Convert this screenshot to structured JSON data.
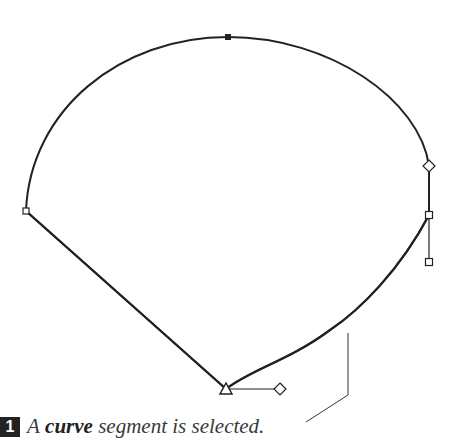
{
  "caption": {
    "step_number": "1",
    "prefix": "A",
    "emphasis": "curve",
    "suffix": "segment is selected."
  },
  "colors": {
    "stroke": "#222222",
    "background": "#ffffff",
    "badge": "#222222"
  },
  "shape": {
    "anchors": [
      {
        "name": "top",
        "x": 228,
        "y": 37,
        "type": "square-filled"
      },
      {
        "name": "left",
        "x": 26,
        "y": 211,
        "type": "square"
      },
      {
        "name": "right",
        "x": 429,
        "y": 215,
        "type": "square"
      },
      {
        "name": "bottom",
        "x": 226,
        "y": 389,
        "type": "triangle"
      }
    ],
    "handles": [
      {
        "name": "right-handle-top",
        "x": 429,
        "y": 166,
        "type": "diamond"
      },
      {
        "name": "right-handle-bottom",
        "x": 429,
        "y": 262,
        "type": "square"
      },
      {
        "name": "bottom-handle",
        "x": 280,
        "y": 389,
        "type": "diamond"
      }
    ]
  }
}
